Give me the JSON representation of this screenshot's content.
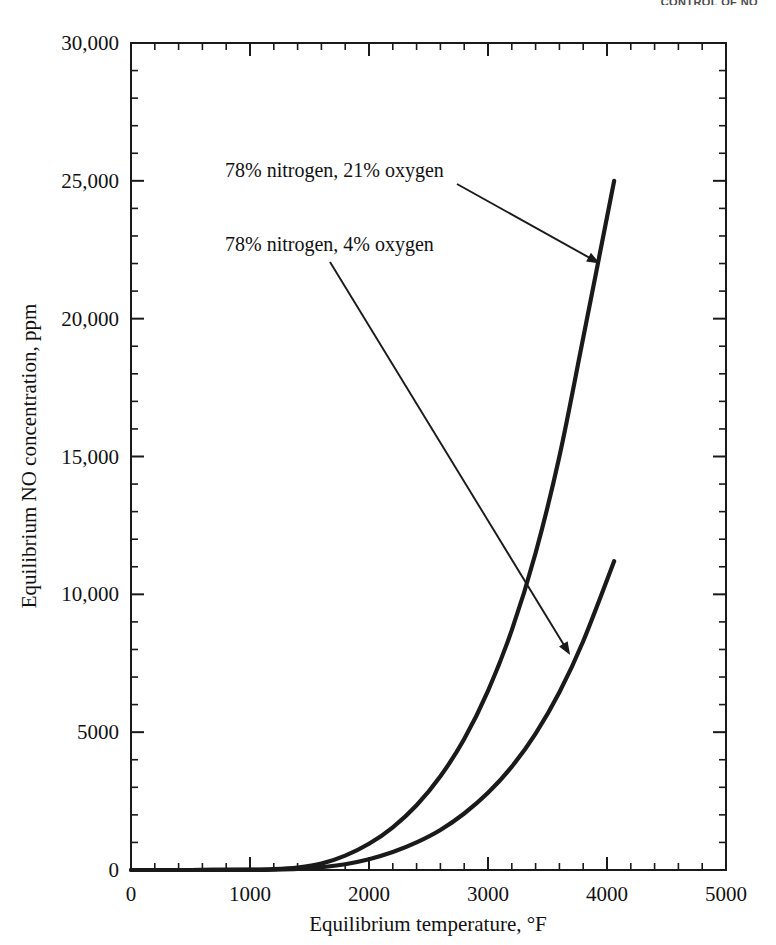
{
  "running_head": "CONTROL OF NO",
  "chart_data": {
    "type": "line",
    "title": "",
    "xlabel": "Equilibrium temperature, °F",
    "ylabel": "Equilibrium NO concentration, ppm",
    "xlim": [
      0,
      5000
    ],
    "ylim": [
      0,
      30000
    ],
    "grid": false,
    "legend_position": "annotations-with-arrows",
    "x_major_ticks": [
      0,
      1000,
      2000,
      3000,
      4000,
      5000
    ],
    "x_tick_labels": [
      "0",
      "1000",
      "2000",
      "3000",
      "4000",
      "5000"
    ],
    "x_minor_step": 200,
    "y_major_ticks": [
      0,
      5000,
      10000,
      15000,
      20000,
      25000,
      30000
    ],
    "y_tick_labels": [
      "0",
      "5000",
      "10,000",
      "15,000",
      "20,000",
      "25,000",
      "30,000"
    ],
    "y_minor_step": 1000,
    "series": [
      {
        "name": "78% nitrogen, 21% oxygen",
        "x": [
          0,
          500,
          1000,
          1200,
          1400,
          1600,
          1800,
          2000,
          2200,
          2400,
          2600,
          2800,
          3000,
          3200,
          3400,
          3600,
          3800,
          4060
        ],
        "values": [
          0,
          0,
          10,
          30,
          90,
          230,
          520,
          950,
          1550,
          2350,
          3400,
          4750,
          6500,
          8700,
          11500,
          15000,
          19300,
          25000
        ]
      },
      {
        "name": "78% nitrogen, 4% oxygen",
        "x": [
          0,
          500,
          1000,
          1200,
          1400,
          1600,
          1800,
          2000,
          2200,
          2400,
          2600,
          2800,
          3000,
          3200,
          3400,
          3600,
          3800,
          4060
        ],
        "values": [
          0,
          0,
          5,
          15,
          40,
          100,
          210,
          390,
          650,
          1000,
          1450,
          2050,
          2800,
          3750,
          4950,
          6450,
          8300,
          11200
        ]
      }
    ],
    "annotations": [
      {
        "text": "78% nitrogen, 21% oxygen",
        "target_series": "78% nitrogen, 21% oxygen",
        "target_x": 3940,
        "target_y": 22000
      },
      {
        "text": "78% nitrogen, 4% oxygen",
        "target_series": "78% nitrogen, 4% oxygen",
        "target_x": 3690,
        "target_y": 7800
      }
    ]
  },
  "colors": {
    "ink": "#1a1a1a",
    "background": "#ffffff"
  }
}
